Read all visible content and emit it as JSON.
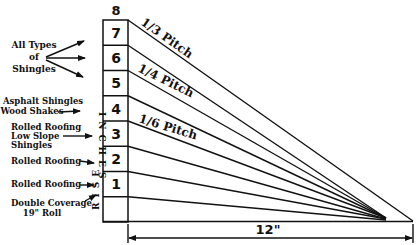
{
  "diagram": {
    "top_label": "8",
    "row_numbers": [
      "7",
      "6",
      "5",
      "4",
      "3",
      "2",
      "1",
      ""
    ],
    "vertical_label_top": "INCHES",
    "vertical_label_bottom": "RISE",
    "pitch_labels": [
      "1/3 Pitch",
      "1/4 Pitch",
      "1/6 Pitch"
    ],
    "run_label": "12\"",
    "left_labels": {
      "all_types": [
        "All Types",
        "of",
        "Shingles"
      ],
      "asphalt": [
        "Asphalt Shingles",
        "Wood Shakes"
      ],
      "rolled_low": [
        "Rolled Roofing",
        "Low Slope",
        "Shingles"
      ],
      "rolled_2": "Rolled Roofing",
      "rolled_1": "Rolled Roofing",
      "double": [
        "Double Coverage",
        "19\" Roll"
      ]
    }
  }
}
